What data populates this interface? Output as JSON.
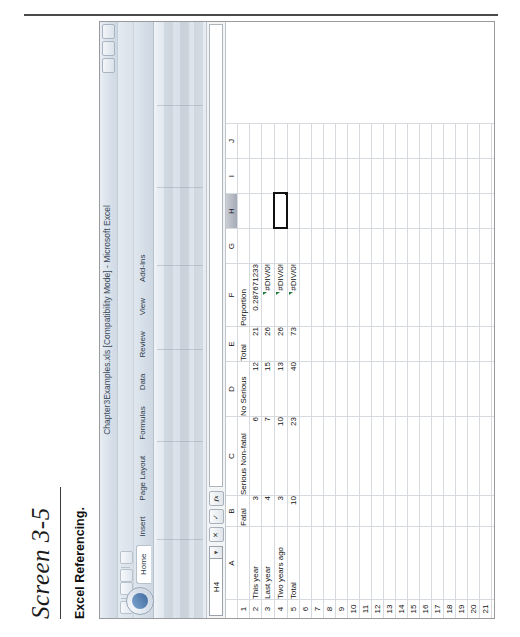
{
  "book": {
    "screen_label": "Screen 3-5",
    "figure_title": "Excel Referencing."
  },
  "window": {
    "title": "Chapter3Examples.xls [Compatibility Mode] - Microsoft Excel",
    "buttons": {
      "minimize": "–",
      "maximize": "▭",
      "close": "✕"
    }
  },
  "quick_access": {
    "items": [
      "save-icon",
      "undo-icon",
      "redo-icon",
      "customize-icon"
    ]
  },
  "ribbon": {
    "office_button": "office-orb",
    "tabs": [
      {
        "label": "Home",
        "active": true
      },
      {
        "label": "Insert",
        "active": false
      },
      {
        "label": "Page Layout",
        "active": false
      },
      {
        "label": "Formulas",
        "active": false
      },
      {
        "label": "Data",
        "active": false
      },
      {
        "label": "Review",
        "active": false
      },
      {
        "label": "View",
        "active": false
      },
      {
        "label": "Add-Ins",
        "active": false
      }
    ]
  },
  "formula_bar": {
    "name_box": "H4",
    "cancel_label": "✕",
    "enter_label": "✓",
    "fx_label": "fx",
    "formula": ""
  },
  "sheet": {
    "columns": [
      "A",
      "B",
      "C",
      "D",
      "E",
      "F",
      "G",
      "H",
      "I",
      "J"
    ],
    "selected_column": "H",
    "selected_cell": "H4",
    "row_count": 36,
    "rows": [
      {
        "n": 1,
        "cells": [
          "",
          "Fatal",
          "Serious Non-fatal",
          "No Serious",
          "Total",
          "Porportion",
          "",
          "",
          "",
          ""
        ],
        "header": true
      },
      {
        "n": 2,
        "cells": [
          "This year",
          "3",
          "6",
          "12",
          "21",
          "0.287671233",
          "",
          "",
          "",
          ""
        ],
        "header": false
      },
      {
        "n": 3,
        "cells": [
          "Last year",
          "4",
          "7",
          "15",
          "26",
          "#DIV/0!",
          "",
          "",
          "",
          ""
        ],
        "header": false
      },
      {
        "n": 4,
        "cells": [
          "Two years ago",
          "3",
          "10",
          "13",
          "26",
          "#DIV/0!",
          "",
          "",
          "",
          ""
        ],
        "header": false
      },
      {
        "n": 5,
        "cells": [
          "Total",
          "10",
          "23",
          "40",
          "73",
          "#DIV/0!",
          "",
          "",
          "",
          ""
        ],
        "header": false
      }
    ],
    "error_cells": [
      "F3",
      "F4",
      "F5"
    ]
  },
  "colors": {
    "title_bar": "#dbe3ec",
    "ribbon": "#d7dee7",
    "grid_line": "#d6d9de",
    "header": "#e6eaf0",
    "selection": "#111111",
    "error_marker": "#1d7a38"
  }
}
